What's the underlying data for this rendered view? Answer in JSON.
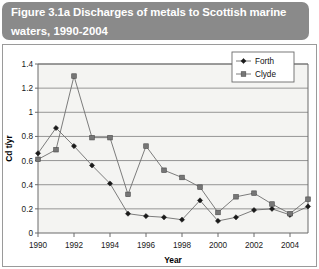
{
  "figure": {
    "title": "Figure 3.1a  Discharges of metals to Scottish marine waters, 1990-2004",
    "title_line1": "Figure 3.1a  Discharges of metals to Scottish marine",
    "title_line2": "waters, 1990-2004",
    "banner_color": "#8a8a8a",
    "title_color": "#ffffff"
  },
  "chart_data": {
    "type": "line",
    "title": "Discharges of metals to Scottish marine waters, 1990-2004",
    "xlabel": "Year",
    "ylabel": "Cd t/yr",
    "xlim": [
      1990,
      2005
    ],
    "ylim": [
      0,
      1.4
    ],
    "grid": true,
    "legend_position": "top-right",
    "x": [
      1990,
      1991,
      1992,
      1993,
      1994,
      1995,
      1996,
      1997,
      1998,
      1999,
      2000,
      2001,
      2002,
      2003,
      2004,
      2005
    ],
    "xticks": [
      1990,
      1992,
      1994,
      1996,
      1998,
      2000,
      2002,
      2004
    ],
    "xtick_labels": [
      "1990",
      "1992",
      "1994",
      "1996",
      "1998",
      "2000",
      "2002",
      "2004"
    ],
    "yticks": [
      0,
      0.2,
      0.4,
      0.6,
      0.8,
      1,
      1.2,
      1.4
    ],
    "ytick_labels": [
      "0",
      "0.2",
      "0.4",
      "0.6",
      "0.8",
      "1",
      "1.2",
      "1.4"
    ],
    "series": [
      {
        "name": "Forth",
        "marker": "diamond",
        "color": "#1a1a1a",
        "values": [
          0.66,
          0.87,
          0.72,
          0.56,
          0.41,
          0.16,
          0.14,
          0.13,
          0.11,
          0.27,
          0.1,
          0.13,
          0.19,
          0.2,
          0.15,
          0.22
        ]
      },
      {
        "name": "Clyde",
        "marker": "square",
        "color": "#767676",
        "values": [
          0.61,
          0.69,
          1.3,
          0.79,
          0.79,
          0.32,
          0.72,
          0.52,
          0.46,
          0.38,
          0.17,
          0.3,
          0.33,
          0.24,
          0.16,
          0.28
        ]
      }
    ]
  },
  "legend": {
    "items": [
      {
        "label": "Forth",
        "marker": "diamond",
        "color": "#1a1a1a"
      },
      {
        "label": "Clyde",
        "marker": "square",
        "color": "#767676"
      }
    ]
  }
}
